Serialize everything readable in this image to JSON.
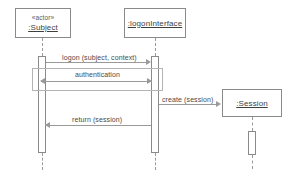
{
  "diagram": {
    "type": "uml-sequence-diagram",
    "title": "",
    "background_color": "#ffffff",
    "line_color": "#9a9a9a",
    "border_color": "#8a8a8a",
    "text_color": "#4a4a4a",
    "participants": [
      {
        "id": "subject",
        "stereotype": "«actor»",
        "name": ":Subject",
        "has_stereotype": true
      },
      {
        "id": "logon_interface",
        "stereotype": "",
        "name": ":logonInterface",
        "has_stereotype": false
      },
      {
        "id": "session",
        "stereotype": "",
        "name": ":Session",
        "has_stereotype": false
      }
    ],
    "messages": [
      {
        "id": "msg-logon",
        "label": "logon (subject, context)",
        "from": "subject",
        "to": "logon_interface",
        "direction": "right"
      },
      {
        "id": "msg-authentication",
        "label": "authentication",
        "from": "logon_interface",
        "to": "subject",
        "direction": "both"
      },
      {
        "id": "msg-create",
        "label": "create (session)",
        "from": "logon_interface",
        "to": "session",
        "direction": "right"
      },
      {
        "id": "msg-return",
        "label": "return (session)",
        "from": "logon_interface",
        "to": "subject",
        "direction": "left"
      }
    ]
  }
}
